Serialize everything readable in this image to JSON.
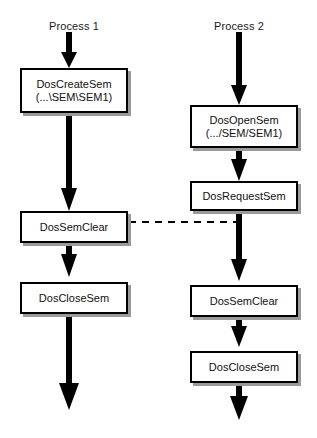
{
  "diagram": {
    "type": "flowchart",
    "background_color": "#ffffff",
    "box_border_color": "#000000",
    "box_fill_color": "#ffffff",
    "shadow_color": "#9a9a9a",
    "arrow_color": "#000000",
    "dashed_link_color": "#000000"
  },
  "columns": [
    {
      "id": "process-1",
      "title": "Process 1",
      "nodes": [
        {
          "id": "p1-create",
          "line1": "DosCreateSem",
          "line2": "(...\\SEM\\SEM1)"
        },
        {
          "id": "p1-semclear",
          "line1": "DosSemClear",
          "line2": ""
        },
        {
          "id": "p1-closesem",
          "line1": "DosCloseSem",
          "line2": ""
        }
      ]
    },
    {
      "id": "process-2",
      "title": "Process 2",
      "nodes": [
        {
          "id": "p2-open",
          "line1": "DosOpenSem",
          "line2": "(.../SEM/SEM1)"
        },
        {
          "id": "p2-request",
          "line1": "DosRequestSem",
          "line2": ""
        },
        {
          "id": "p2-semclear",
          "line1": "DosSemClear",
          "line2": ""
        },
        {
          "id": "p2-closesem",
          "line1": "DosCloseSem",
          "line2": ""
        }
      ]
    }
  ],
  "links": [
    {
      "id": "signal-link",
      "from": "p1-semclear",
      "to": "process-2-flow",
      "style": "dashed",
      "label": ""
    }
  ]
}
